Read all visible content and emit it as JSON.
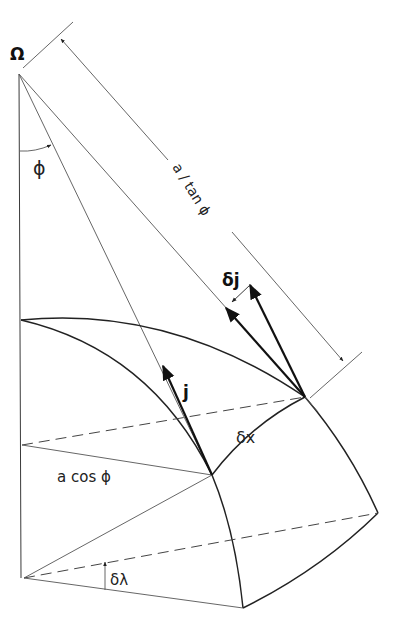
{
  "figure": {
    "labels": {
      "omega": "Ω",
      "phi": "ϕ",
      "a_over_tan_phi": "a / tan ϕ",
      "delta_j": "δj",
      "j": "j",
      "delta_x": "δx",
      "a_cos_phi": "a cos ϕ",
      "delta_lambda": "δλ"
    },
    "colors": {
      "background": "#ffffff",
      "line": "#333333"
    }
  }
}
